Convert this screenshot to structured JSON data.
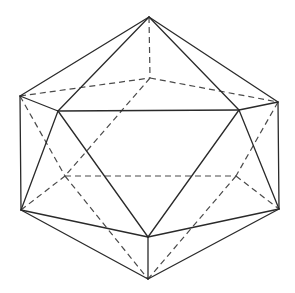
{
  "diagram": {
    "title": "",
    "shape": "icosahedron",
    "style": {
      "background": "#ffffff",
      "solid_color": "#2a2a2a",
      "dashed_color": "#4a4a4a"
    },
    "vertices": {
      "T": [
        149,
        17
      ],
      "B": [
        150,
        78
      ],
      "L": [
        20,
        96
      ],
      "R": [
        278,
        102
      ],
      "FL": [
        58,
        111
      ],
      "FR": [
        239,
        110
      ],
      "LL": [
        65,
        176
      ],
      "LR": [
        236,
        176
      ],
      "BL": [
        21,
        210
      ],
      "BR": [
        279,
        209
      ],
      "FB": [
        148,
        237
      ],
      "Bt": [
        148,
        279
      ]
    },
    "solid_edges": [
      [
        "T",
        "L"
      ],
      [
        "T",
        "R"
      ],
      [
        "T",
        "FL"
      ],
      [
        "T",
        "FR"
      ],
      [
        "L",
        "FL"
      ],
      [
        "FL",
        "FR"
      ],
      [
        "FR",
        "R"
      ],
      [
        "L",
        "BL"
      ],
      [
        "R",
        "BR"
      ],
      [
        "FL",
        "BL"
      ],
      [
        "FL",
        "FB"
      ],
      [
        "FR",
        "FB"
      ],
      [
        "FR",
        "BR"
      ],
      [
        "BL",
        "FB"
      ],
      [
        "FB",
        "BR"
      ],
      [
        "BL",
        "Bt"
      ],
      [
        "BR",
        "Bt"
      ],
      [
        "FB",
        "Bt"
      ]
    ],
    "dashed_edges": [
      [
        "T",
        "B"
      ],
      [
        "L",
        "B"
      ],
      [
        "B",
        "R"
      ],
      [
        "L",
        "LL"
      ],
      [
        "BL",
        "LL"
      ],
      [
        "B",
        "LL"
      ],
      [
        "LL",
        "LR"
      ],
      [
        "LL",
        "Bt"
      ],
      [
        "R",
        "LR"
      ],
      [
        "LR",
        "BR"
      ],
      [
        "LR",
        "Bt"
      ]
    ]
  }
}
